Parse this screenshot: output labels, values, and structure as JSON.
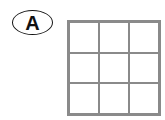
{
  "label": {
    "text": "A",
    "shape": "oval"
  },
  "grid": {
    "rows": 3,
    "cols": 3,
    "line_color": "#8a8a8a",
    "cells": [
      [
        "",
        "",
        ""
      ],
      [
        "",
        "",
        ""
      ],
      [
        "",
        "",
        ""
      ]
    ]
  }
}
